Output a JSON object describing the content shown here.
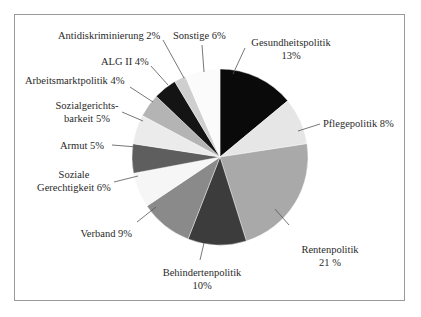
{
  "chart_data": {
    "type": "pie",
    "title": "",
    "start_angle_deg": 0,
    "direction": "clockwise",
    "slices": [
      {
        "label": "Gesundheitspolitik",
        "value": 13,
        "display": "13%",
        "color": "#0a0a0a"
      },
      {
        "label": "Pflegepolitik",
        "value": 8,
        "display": "8%",
        "color": "#e6e6e6"
      },
      {
        "label": "Rentenpolitik",
        "value": 21,
        "display": "21%",
        "color": "#a9a9a9"
      },
      {
        "label": "Behindertenpolitik",
        "value": 10,
        "display": "10%",
        "color": "#3c3c3c"
      },
      {
        "label": "Verband",
        "value": 9,
        "display": "9%",
        "color": "#8a8a8a"
      },
      {
        "label": "Soziale Gerechtigkeit",
        "value": 6,
        "display": "6%",
        "color": "#f6f6f6"
      },
      {
        "label": "Armut",
        "value": 5,
        "display": "5%",
        "color": "#5e5e5e"
      },
      {
        "label": "Sozialgerichtsbarkeit",
        "value": 5,
        "display": "5%",
        "color": "#ebebeb"
      },
      {
        "label": "Arbeitsmarktpolitik",
        "value": 4,
        "display": "4%",
        "color": "#b4b4b4"
      },
      {
        "label": "ALG II",
        "value": 4,
        "display": "4%",
        "color": "#141414"
      },
      {
        "label": "Antidiskriminierung",
        "value": 2,
        "display": "2%",
        "color": "#cfcfcf"
      },
      {
        "label": "Sonstige",
        "value": 6,
        "display": "6%",
        "color": "#fbfbfb"
      }
    ],
    "legend": "none (callout labels)"
  },
  "labels": {
    "gesundheit_name": "Gesundheitspolitik",
    "gesundheit_pct": "13%",
    "pflege": "Pflegepolitik  8%",
    "renten_name": "Rentenpolitik",
    "renten_pct": "21 %",
    "behinderten_name": "Behindertenpolitik",
    "behinderten_pct": "10%",
    "verband": "Verband  9%",
    "soziale_1": "Soziale",
    "soziale_2": "Gerechtigkeit  6%",
    "armut": "Armut  5%",
    "sozialgericht_1": "Sozialgerichts-",
    "sozialgericht_2": "barkeit  5%",
    "arbeitsmarkt": "Arbeitsmarktpolitik  4%",
    "alg": "ALG II  4%",
    "antidiskr": "Antidiskriminierung  2%",
    "sonstige": "Sonstige  6%"
  }
}
